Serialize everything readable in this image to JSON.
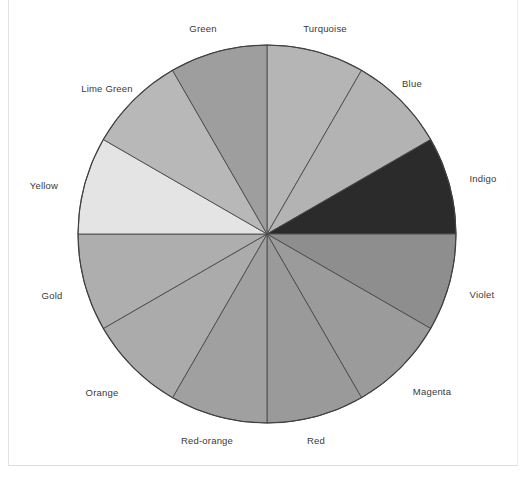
{
  "figure": {
    "kind": "color-wheel-pie",
    "background_color": "#ffffff",
    "center_x": 267,
    "center_y": 234,
    "radius": 189,
    "outline_color": "#3f3f3f",
    "divider_color": "#4a4a4a",
    "label_color": "#3a3a3a"
  },
  "chart_data": {
    "type": "pie",
    "title": "",
    "subtitle": "",
    "xlabel": "",
    "ylabel": "",
    "legend_position": "radial-outside-labels",
    "grid": false,
    "equal_slices": true,
    "slice_count": 12,
    "slice_degrees": 30,
    "start_angle_deg": 90,
    "direction": "clockwise",
    "categories": [
      "Turquoise",
      "Blue",
      "Indigo",
      "Violet",
      "Magenta",
      "Red",
      "Red-orange",
      "Orange",
      "Gold",
      "Yellow",
      "Lime Green",
      "Green"
    ],
    "values": [
      30,
      30,
      30,
      30,
      30,
      30,
      30,
      30,
      30,
      30,
      30,
      30
    ],
    "percentages": [
      8.33,
      8.33,
      8.33,
      8.33,
      8.33,
      8.33,
      8.33,
      8.33,
      8.33,
      8.33,
      8.33,
      8.33
    ],
    "slices": [
      {
        "label": "Turquoise",
        "start_deg": 90,
        "end_deg": 60,
        "fill": "#b5b5b5",
        "label_x": 325,
        "label_y": 28
      },
      {
        "label": "Blue",
        "start_deg": 60,
        "end_deg": 30,
        "fill": "#b3b3b3",
        "label_x": 412,
        "label_y": 83
      },
      {
        "label": "Indigo",
        "start_deg": 30,
        "end_deg": 0,
        "fill": "#2b2b2b",
        "label_x": 483,
        "label_y": 178
      },
      {
        "label": "Violet",
        "start_deg": 0,
        "end_deg": -30,
        "fill": "#8e8e8e",
        "label_x": 482,
        "label_y": 294
      },
      {
        "label": "Magenta",
        "start_deg": -30,
        "end_deg": -60,
        "fill": "#9b9b9b",
        "label_x": 432,
        "label_y": 391
      },
      {
        "label": "Red",
        "start_deg": -60,
        "end_deg": -90,
        "fill": "#9a9a9a",
        "label_x": 316,
        "label_y": 440
      },
      {
        "label": "Red-orange",
        "start_deg": -90,
        "end_deg": -120,
        "fill": "#a0a0a0",
        "label_x": 207,
        "label_y": 440
      },
      {
        "label": "Orange",
        "start_deg": -120,
        "end_deg": -150,
        "fill": "#ababab",
        "label_x": 102,
        "label_y": 392
      },
      {
        "label": "Gold",
        "start_deg": -150,
        "end_deg": -180,
        "fill": "#aeaeae",
        "label_x": 52,
        "label_y": 295
      },
      {
        "label": "Yellow",
        "start_deg": 180,
        "end_deg": 150,
        "fill": "#e4e4e4",
        "label_x": 44,
        "label_y": 185
      },
      {
        "label": "Lime Green",
        "start_deg": 150,
        "end_deg": 120,
        "fill": "#b8b8b8",
        "label_x": 107,
        "label_y": 88
      },
      {
        "label": "Green",
        "start_deg": 120,
        "end_deg": 90,
        "fill": "#9e9e9e",
        "label_x": 203,
        "label_y": 28
      }
    ]
  }
}
